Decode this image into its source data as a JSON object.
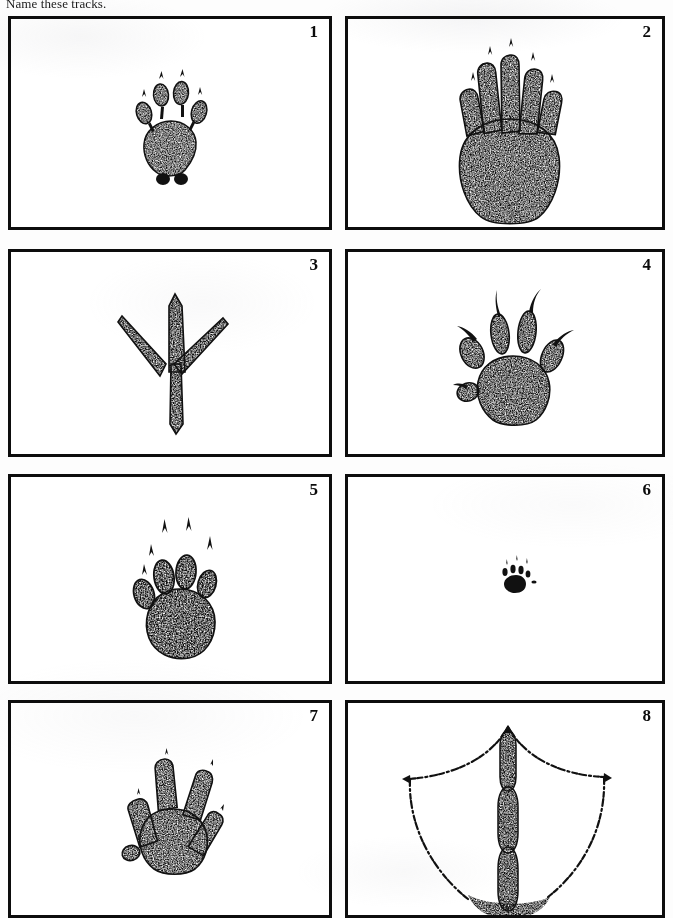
{
  "page": {
    "prompt": "Name these tracks.",
    "background_color": "#fdfdfd",
    "ink_color": "#0d0d0d",
    "layout": "4 rows x 2 columns of bordered track illustrations"
  },
  "cells": [
    {
      "number": "1",
      "track": "four-toed-pad-track-with-heel-dots",
      "row": 1,
      "col": 1
    },
    {
      "number": "2",
      "track": "five-long-fingered-hand-track",
      "row": 1,
      "col": 2
    },
    {
      "number": "3",
      "track": "three-toed-bird-track-with-hind-toe",
      "row": 2,
      "col": 1
    },
    {
      "number": "4",
      "track": "five-clawed-rodent-hand-track",
      "row": 2,
      "col": 2
    },
    {
      "number": "5",
      "track": "five-toed-paw-with-long-claws",
      "row": 3,
      "col": 1
    },
    {
      "number": "6",
      "track": "tiny-mouse-track",
      "row": 3,
      "col": 2
    },
    {
      "number": "7",
      "track": "four-toed-webbed-clawed-track",
      "row": 4,
      "col": 1
    },
    {
      "number": "8",
      "track": "webbed-waterfowl-foot-outline",
      "row": 4,
      "col": 2
    }
  ]
}
